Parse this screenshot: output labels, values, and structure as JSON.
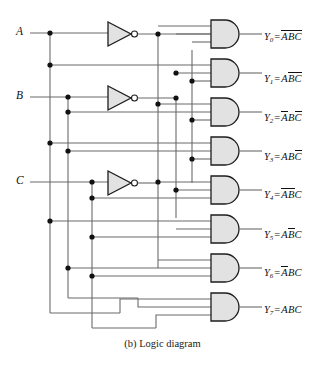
{
  "figure": {
    "caption": "(b) Logic diagram",
    "type": "logic-diagram",
    "colors": {
      "wire": "#6b6b6b",
      "gate_outline": "#1c1c1c",
      "gate_fill": "#e2e2e2",
      "junction_dot": "#111111",
      "background": "#ffffff"
    }
  },
  "inputs": [
    {
      "name": "input-a",
      "label": "A",
      "x": 18,
      "y": 33
    },
    {
      "name": "input-b",
      "label": "B",
      "x": 18,
      "y": 97
    },
    {
      "name": "input-c",
      "label": "C",
      "x": 18,
      "y": 182
    }
  ],
  "inverters": [
    {
      "name": "inverter-a",
      "input": "A",
      "output": "A-bar"
    },
    {
      "name": "inverter-b",
      "input": "B",
      "output": "B-bar"
    },
    {
      "name": "inverter-c",
      "input": "C",
      "output": "C-bar"
    }
  ],
  "gates": [
    {
      "name": "and-gate-y0",
      "index": 0,
      "inputs": [
        "A-bar",
        "B-bar",
        "C-bar"
      ]
    },
    {
      "name": "and-gate-y1",
      "index": 1,
      "inputs": [
        "A",
        "B-bar",
        "C-bar"
      ]
    },
    {
      "name": "and-gate-y2",
      "index": 2,
      "inputs": [
        "A-bar",
        "B",
        "C-bar"
      ]
    },
    {
      "name": "and-gate-y3",
      "index": 3,
      "inputs": [
        "A",
        "B",
        "C-bar"
      ]
    },
    {
      "name": "and-gate-y4",
      "index": 4,
      "inputs": [
        "A-bar",
        "B-bar",
        "C"
      ]
    },
    {
      "name": "and-gate-y5",
      "index": 5,
      "inputs": [
        "A",
        "B-bar",
        "C"
      ]
    },
    {
      "name": "and-gate-y6",
      "index": 6,
      "inputs": [
        "A-bar",
        "B",
        "C"
      ]
    },
    {
      "name": "and-gate-y7",
      "index": 7,
      "inputs": [
        "A",
        "B",
        "C"
      ]
    }
  ],
  "outputs": [
    {
      "name": "output-y0",
      "y_label": "Y",
      "sub": "0",
      "eq": "=",
      "terms": [
        {
          "t": "A",
          "bar": true
        },
        {
          "t": "B",
          "bar": true
        },
        {
          "t": "C",
          "bar": true
        }
      ],
      "text": "Y0 = ĀB̄C̄",
      "top": 30
    },
    {
      "name": "output-y1",
      "y_label": "Y",
      "sub": "1",
      "eq": "=",
      "terms": [
        {
          "t": "A",
          "bar": false
        },
        {
          "t": "B",
          "bar": true
        },
        {
          "t": "C",
          "bar": true
        }
      ],
      "text": "Y1 = AB̄C̄",
      "top": 72
    },
    {
      "name": "output-y2",
      "y_label": "Y",
      "sub": "2",
      "eq": "=",
      "terms": [
        {
          "t": "A",
          "bar": true
        },
        {
          "t": "B",
          "bar": false
        },
        {
          "t": "C",
          "bar": true
        }
      ],
      "text": "Y2 = ĀBC̄",
      "top": 111
    },
    {
      "name": "output-y3",
      "y_label": "Y",
      "sub": "3",
      "eq": "=",
      "terms": [
        {
          "t": "A",
          "bar": false
        },
        {
          "t": "B",
          "bar": false
        },
        {
          "t": "C",
          "bar": true
        }
      ],
      "text": "Y3 = ABC̄",
      "top": 150
    },
    {
      "name": "output-y4",
      "y_label": "Y",
      "sub": "4",
      "eq": "=",
      "terms": [
        {
          "t": "A",
          "bar": true
        },
        {
          "t": "B",
          "bar": true
        },
        {
          "t": "C",
          "bar": false
        }
      ],
      "text": "Y4 = ĀB̄C",
      "top": 188
    },
    {
      "name": "output-y5",
      "y_label": "Y",
      "sub": "5",
      "eq": "=",
      "terms": [
        {
          "t": "A",
          "bar": false
        },
        {
          "t": "B",
          "bar": true
        },
        {
          "t": "C",
          "bar": false
        }
      ],
      "text": "Y5 = AB̄C",
      "top": 228
    },
    {
      "name": "output-y6",
      "y_label": "Y",
      "sub": "6",
      "eq": "=",
      "terms": [
        {
          "t": "A",
          "bar": true
        },
        {
          "t": "B",
          "bar": false
        },
        {
          "t": "C",
          "bar": false
        }
      ],
      "text": "Y6 = ĀBC",
      "top": 266
    },
    {
      "name": "output-y7",
      "y_label": "Y",
      "sub": "7",
      "eq": "=",
      "terms": [
        {
          "t": "A",
          "bar": false
        },
        {
          "t": "B",
          "bar": false
        },
        {
          "t": "C",
          "bar": false
        }
      ],
      "text": "Y7 = ABC",
      "top": 305
    }
  ]
}
